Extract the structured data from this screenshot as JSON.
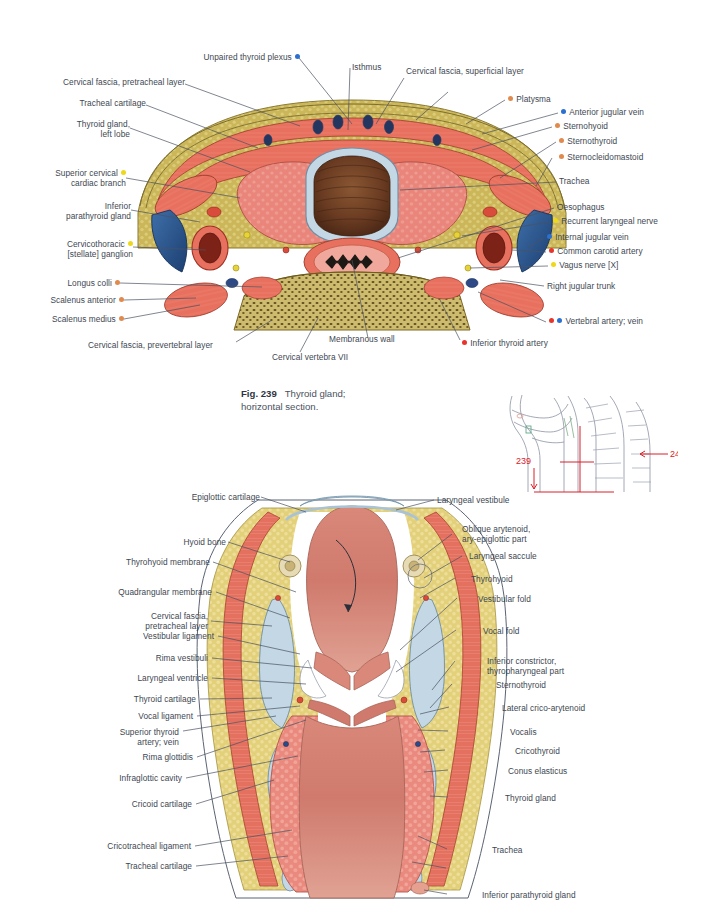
{
  "page": {
    "figures": [
      {
        "id": "fig-239",
        "number": "Fig. 239",
        "caption_line1": "Thyroid gland;",
        "caption_line2": "horizontal section.",
        "caption_full": "Fig. 239  Thyroid gland; horizontal section."
      },
      {
        "id": "fig-240",
        "number": "240"
      }
    ],
    "mini_diagram": {
      "name": "orientation-diagram",
      "marker_upper": "239",
      "marker_lower": "240"
    },
    "fig239_labels": {
      "top": [
        {
          "text": "Unpaired thyroid plexus",
          "bullets": [
            "blue"
          ],
          "side": "right"
        },
        {
          "text": "Isthmus",
          "bullets": [],
          "side": "left"
        },
        {
          "text": "Cervical fascia, superficial layer",
          "bullets": [],
          "side": "left"
        }
      ],
      "left": [
        {
          "text": "Cervical fascia, pretracheal layer",
          "bullets": []
        },
        {
          "text": "Tracheal cartilage",
          "bullets": []
        },
        {
          "text": "Thyroid gland,",
          "text2": "left lobe",
          "bullets": []
        },
        {
          "text": "Superior cervical",
          "text2": "cardiac branch",
          "bullets": [
            "yellow"
          ]
        },
        {
          "text": "Inferior",
          "text2": "parathyroid gland",
          "bullets": []
        },
        {
          "text": "Cervicothoracic",
          "text2": "[stellate] ganglion",
          "bullets": [
            "yellow"
          ]
        },
        {
          "text": "Longus colli",
          "bullets": [
            "orange"
          ]
        },
        {
          "text": "Scalenus anterior",
          "bullets": [
            "orange"
          ]
        },
        {
          "text": "Scalenus medius",
          "bullets": [
            "orange"
          ]
        }
      ],
      "right": [
        {
          "text": "Platysma",
          "bullets": [
            "orange"
          ]
        },
        {
          "text": "Anterior jugular vein",
          "bullets": [
            "blue"
          ]
        },
        {
          "text": "Sternohyoid",
          "bullets": [
            "orange"
          ]
        },
        {
          "text": "Sternothyroid",
          "bullets": [
            "orange"
          ]
        },
        {
          "text": "Sternocleidomastoid",
          "bullets": [
            "orange"
          ]
        },
        {
          "text": "Trachea",
          "bullets": []
        },
        {
          "text": "Oesophagus",
          "bullets": []
        },
        {
          "text": "Recurrent laryngeal nerve",
          "bullets": [
            "yellow"
          ]
        },
        {
          "text": "Internal jugular vein",
          "bullets": [
            "blue"
          ]
        },
        {
          "text": "Common carotid artery",
          "bullets": [
            "red"
          ]
        },
        {
          "text": "Vagus nerve [X]",
          "bullets": [
            "yellow"
          ]
        },
        {
          "text": "Right jugular trunk",
          "bullets": []
        },
        {
          "text": "Vertebral artery; vein",
          "bullets": [
            "red",
            "blue"
          ]
        },
        {
          "text": "Inferior thyroid artery",
          "bullets": [
            "red"
          ]
        }
      ],
      "bottom": [
        {
          "text": "Cervical fascia, prevertebral layer",
          "bullets": []
        },
        {
          "text": "Cervical vertebra VII",
          "bullets": []
        },
        {
          "text": "Membranous wall",
          "bullets": []
        }
      ]
    },
    "fig240_labels": {
      "left": [
        {
          "text": "Epiglottic cartilage"
        },
        {
          "text": "Hyoid bone"
        },
        {
          "text": "Thyrohyoid membrane"
        },
        {
          "text": "Quadrangular membrane"
        },
        {
          "text": "Cervical fascia,",
          "text2": "pretracheal layer"
        },
        {
          "text": "Vestibular ligament"
        },
        {
          "text": "Rima vestibuli"
        },
        {
          "text": "Laryngeal ventricle"
        },
        {
          "text": "Thyroid cartilage"
        },
        {
          "text": "Vocal ligament"
        },
        {
          "text": "Superior thyroid",
          "text2": "artery; vein"
        },
        {
          "text": "Rima glottidis"
        },
        {
          "text": "Infraglottic cavity"
        },
        {
          "text": "Cricoid cartilage"
        },
        {
          "text": "Cricotracheal ligament"
        },
        {
          "text": "Tracheal cartilage"
        }
      ],
      "right": [
        {
          "text": "Laryngeal vestibule"
        },
        {
          "text": "Oblique arytenoid,",
          "text2": "ary-epiglottic part"
        },
        {
          "text": "Laryngeal saccule"
        },
        {
          "text": "Thyrohyoid"
        },
        {
          "text": "Vestibular fold"
        },
        {
          "text": "Vocal fold"
        },
        {
          "text": "Inferior constrictor,",
          "text2": "thyropharyngeal part"
        },
        {
          "text": "Sternothyroid"
        },
        {
          "text": "Lateral crico-arytenoid"
        },
        {
          "text": "Vocalis"
        },
        {
          "text": "Cricothyroid"
        },
        {
          "text": "Conus elasticus"
        },
        {
          "text": "Thyroid gland"
        },
        {
          "text": "Trachea"
        },
        {
          "text": "Inferior parathyroid gland"
        }
      ]
    },
    "colors": {
      "text": "#3e4752",
      "leader": "#4a5260",
      "marker_red": "#e8342a",
      "marker_blue": "#2b6fd0",
      "marker_orange": "#e08a4e",
      "marker_yellow": "#edd81c",
      "mini_red": "#d8202a",
      "muscle": "#e8705e",
      "fat": "#cbb659",
      "thyroid": "#e78b80",
      "cartilage": "#c3d7e4",
      "lumen": "#6b3c22",
      "bone": "#ccbb6d"
    }
  }
}
